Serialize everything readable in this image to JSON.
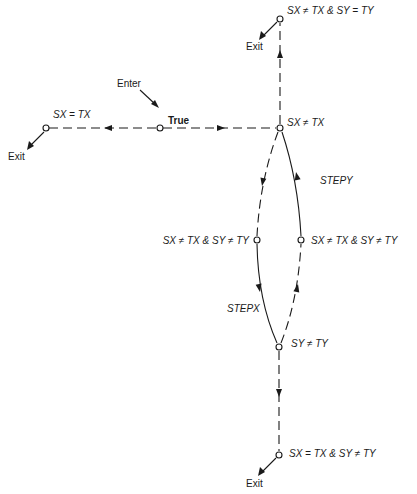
{
  "diagram": {
    "type": "state-transition",
    "nodes": {
      "enter": {
        "label": "True",
        "entry_label": "Enter"
      },
      "sx_eq_tx": {
        "label": "SX = TX",
        "exit_label": "Exit"
      },
      "sx_ne_tx": {
        "label": "SX ≠ TX"
      },
      "top": {
        "label": "SX ≠ TX & SY = TY",
        "exit_label": "Exit"
      },
      "left_mid": {
        "label": "SX ≠ TX & SY ≠ TY"
      },
      "right_mid": {
        "label": "SX ≠ TX & SY ≠ TY"
      },
      "sy_ne_ty": {
        "label": "SY ≠ TY"
      },
      "bottom": {
        "label": "SX = TX & SY ≠ TY",
        "exit_label": "Exit"
      }
    },
    "edges": {
      "stepx": "STEPX",
      "stepy": "STEPY"
    }
  }
}
